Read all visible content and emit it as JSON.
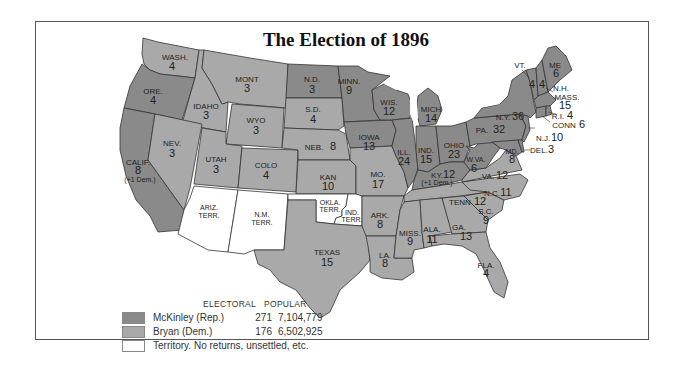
{
  "title": "The Election of 1896",
  "colors": {
    "republican": "#8a8a8a",
    "democrat": "#a9a9a9",
    "territory": "#ffffff",
    "water": "#ffffff",
    "border": "#333333"
  },
  "legend": {
    "header_electoral": "ELECTORAL",
    "header_popular": "POPULAR",
    "entries": [
      {
        "name": "McKinley (Rep.)",
        "electoral": "271",
        "popular": "7,104,779",
        "party": "republican"
      },
      {
        "name": "Bryan (Dem.)",
        "electoral": "176",
        "popular": "6,502,925",
        "party": "democrat"
      },
      {
        "name": "Territory. No returns, unsettled, etc.",
        "electoral": "",
        "popular": "",
        "party": "territory"
      }
    ]
  },
  "states": {
    "wash": {
      "label": "WASH.",
      "votes": "4",
      "party": "democrat"
    },
    "ore": {
      "label": "ORE.",
      "votes": "4",
      "party": "republican"
    },
    "calif": {
      "label": "CALIF.",
      "votes": "8",
      "note": "(+1 Dem.)",
      "party": "republican"
    },
    "idaho": {
      "label": "IDAHO",
      "votes": "3",
      "party": "democrat"
    },
    "nev": {
      "label": "NEV.",
      "votes": "3",
      "party": "democrat"
    },
    "mont": {
      "label": "MONT",
      "votes": "3",
      "party": "democrat"
    },
    "wyo": {
      "label": "WYO",
      "votes": "3",
      "party": "democrat"
    },
    "utah": {
      "label": "UTAH",
      "votes": "3",
      "party": "democrat"
    },
    "colo": {
      "label": "COLO",
      "votes": "4",
      "party": "democrat"
    },
    "ariz": {
      "label": "ARIZ.",
      "label2": "TERR.",
      "party": "territory"
    },
    "nm": {
      "label": "N.M.",
      "label2": "TERR.",
      "party": "territory"
    },
    "nd": {
      "label": "N.D.",
      "votes": "3",
      "party": "republican"
    },
    "sd": {
      "label": "S.D.",
      "votes": "4",
      "party": "democrat"
    },
    "neb": {
      "label": "NEB.",
      "votes": "8",
      "party": "democrat"
    },
    "kan": {
      "label": "KAN",
      "votes": "10",
      "party": "democrat"
    },
    "okla": {
      "label": "OKLA.",
      "label2": "TERR.",
      "party": "territory"
    },
    "ind_terr": {
      "label": "IND.",
      "label2": "TERR.",
      "party": "territory"
    },
    "texas": {
      "label": "TEXAS",
      "votes": "15",
      "party": "democrat"
    },
    "minn": {
      "label": "MINN.",
      "votes": "9",
      "party": "republican"
    },
    "iowa": {
      "label": "IOWA",
      "votes": "13",
      "party": "republican"
    },
    "mo": {
      "label": "MO.",
      "votes": "17",
      "party": "democrat"
    },
    "ark": {
      "label": "ARK.",
      "votes": "8",
      "party": "democrat"
    },
    "la": {
      "label": "LA.",
      "votes": "8",
      "party": "democrat"
    },
    "wis": {
      "label": "WIS.",
      "votes": "12",
      "party": "republican"
    },
    "ill": {
      "label": "ILL.",
      "votes": "24",
      "party": "republican"
    },
    "mich": {
      "label": "MICH",
      "votes": "14",
      "party": "republican"
    },
    "ind": {
      "label": "IND.",
      "votes": "15",
      "party": "republican"
    },
    "ohio": {
      "label": "OHIO",
      "votes": "23",
      "party": "republican"
    },
    "ky": {
      "label": "KY.",
      "votes": "12",
      "note": "(+1 Dem.)",
      "party": "republican"
    },
    "tenn": {
      "label": "TENN",
      "votes": "12",
      "party": "democrat"
    },
    "miss": {
      "label": "MISS.",
      "votes": "9",
      "party": "democrat"
    },
    "ala": {
      "label": "ALA.",
      "votes": "11",
      "party": "democrat"
    },
    "ga": {
      "label": "GA.",
      "votes": "13",
      "party": "democrat"
    },
    "fla": {
      "label": "FLA.",
      "votes": "4",
      "party": "democrat"
    },
    "sc": {
      "label": "S.C.",
      "votes": "9",
      "party": "democrat"
    },
    "nc": {
      "label": "N.C.",
      "votes": "11",
      "party": "democrat"
    },
    "va": {
      "label": "VA.",
      "votes": "12",
      "party": "democrat"
    },
    "wva": {
      "label": "W.VA.",
      "votes": "6",
      "party": "republican"
    },
    "md": {
      "label": "MD.",
      "votes": "8",
      "party": "republican"
    },
    "del": {
      "label": "DEL.",
      "votes": "3",
      "party": "republican"
    },
    "pa": {
      "label": "PA.",
      "votes": "32",
      "party": "republican"
    },
    "nj": {
      "label": "N.J.",
      "votes": "10",
      "party": "republican"
    },
    "ny": {
      "label": "N.Y.",
      "votes": "36",
      "party": "republican"
    },
    "conn": {
      "label": "CONN",
      "votes": "6",
      "party": "republican"
    },
    "ri": {
      "label": "R.I.",
      "votes": "4",
      "party": "republican"
    },
    "mass": {
      "label": "MASS.",
      "votes": "15",
      "party": "republican"
    },
    "vt": {
      "label": "VT.",
      "votes": "4",
      "party": "republican"
    },
    "nh": {
      "label": "N.H.",
      "votes": "4",
      "party": "republican"
    },
    "me": {
      "label": "ME",
      "votes": "6",
      "party": "republican"
    }
  }
}
